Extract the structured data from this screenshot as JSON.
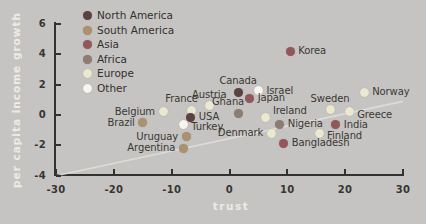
{
  "colors": {
    "background": "#c6c4c2",
    "axis": "#34322e",
    "tick_label": "#383631",
    "point_label": "#3a3833",
    "legend_label": "#33312d",
    "axis_title": "#edebe4",
    "trend_line": "#e0dfda"
  },
  "chart_data": {
    "type": "scatter",
    "title": "",
    "xlabel": "trust",
    "ylabel": "per capita income growth",
    "xlim": [
      -30,
      30
    ],
    "ylim": [
      -4,
      6
    ],
    "x_ticks": [
      -30,
      -20,
      -10,
      0,
      10,
      20,
      30
    ],
    "y_ticks": [
      -4,
      -2,
      0,
      2,
      4,
      6
    ],
    "grid": false,
    "legend_position": "upper-left",
    "groups": [
      {
        "name": "North America",
        "color": "#5a4241"
      },
      {
        "name": "South America",
        "color": "#ab9170"
      },
      {
        "name": "Asia",
        "color": "#93575a"
      },
      {
        "name": "Africa",
        "color": "#8d7d70"
      },
      {
        "name": "Europe",
        "color": "#eae9d0"
      },
      {
        "name": "Other",
        "color": "#f6f5f1"
      }
    ],
    "trend_line": {
      "x1": -30,
      "y1": -4,
      "x2": 30,
      "y2": 0.9
    },
    "points": [
      {
        "label": "Korea",
        "group": "Asia",
        "x": 10.5,
        "y": 4.2,
        "label_pos": "right"
      },
      {
        "label": "Canada",
        "group": "North America",
        "x": 1.5,
        "y": 1.5,
        "label_pos": "above"
      },
      {
        "label": "Israel",
        "group": "Other",
        "x": 5,
        "y": 1.6,
        "label_pos": "right"
      },
      {
        "label": "Japan",
        "group": "Asia",
        "x": 3.5,
        "y": 1.1,
        "label_pos": "right"
      },
      {
        "label": "Austria",
        "group": "Europe",
        "x": -3.5,
        "y": 0.6,
        "label_pos": "above"
      },
      {
        "label": "France",
        "group": "Europe",
        "x": -6.5,
        "y": 0.3,
        "label_pos": "above-left"
      },
      {
        "label": "Ghana",
        "group": "Africa",
        "x": 1.5,
        "y": 0.1,
        "label_pos": "above-left"
      },
      {
        "label": "Belgium",
        "group": "Europe",
        "x": -11.5,
        "y": 0.2,
        "label_pos": "left"
      },
      {
        "label": "Brazil",
        "group": "South America",
        "x": -15,
        "y": -0.5,
        "label_pos": "left"
      },
      {
        "label": "USA",
        "group": "North America",
        "x": -6.7,
        "y": -0.15,
        "label_pos": "right"
      },
      {
        "label": "Turkey",
        "group": "Other",
        "x": -8,
        "y": -0.6,
        "label_pos": "below-right"
      },
      {
        "label": "Uruguay",
        "group": "South America",
        "x": -7.5,
        "y": -1.45,
        "label_pos": "left"
      },
      {
        "label": "Argentina",
        "group": "South America",
        "x": -8,
        "y": -2.2,
        "label_pos": "left"
      },
      {
        "label": "Ireland",
        "group": "Europe",
        "x": 6.3,
        "y": -0.15,
        "label_pos": "above-right"
      },
      {
        "label": "Denmark",
        "group": "Europe",
        "x": 7.2,
        "y": -1.2,
        "label_pos": "left"
      },
      {
        "label": "Nigeria",
        "group": "Africa",
        "x": 8.7,
        "y": -0.6,
        "label_pos": "right"
      },
      {
        "label": "Bangladesh",
        "group": "Asia",
        "x": 9.4,
        "y": -1.85,
        "label_pos": "right"
      },
      {
        "label": "Sweden",
        "group": "Europe",
        "x": 17.4,
        "y": 0.35,
        "label_pos": "above"
      },
      {
        "label": "Norway",
        "group": "Europe",
        "x": 23.3,
        "y": 1.5,
        "label_pos": "right"
      },
      {
        "label": "Greece",
        "group": "Europe",
        "x": 20.7,
        "y": 0.2,
        "label_pos": "below-right"
      },
      {
        "label": "India",
        "group": "Asia",
        "x": 18.4,
        "y": -0.65,
        "label_pos": "right"
      },
      {
        "label": "Finland",
        "group": "Europe",
        "x": 15.5,
        "y": -1.2,
        "label_pos": "below-right"
      }
    ]
  }
}
